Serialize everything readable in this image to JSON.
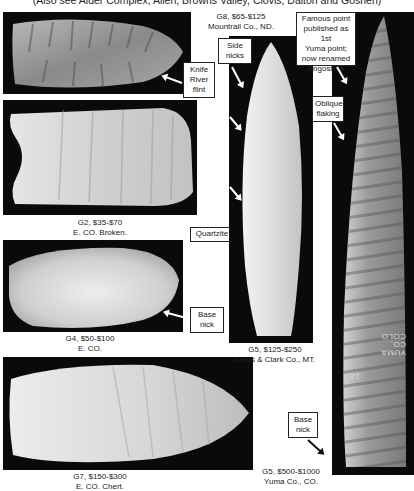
{
  "header": {
    "text": "(Also see Alder Complex, Allen, Browns Valley, Clovis, Dalton and Goshen)"
  },
  "points": [
    {
      "id": "g8",
      "grade": "G8, $65-$125",
      "location": "Mountrail Co., ND.",
      "callouts": [
        "Knife River flint"
      ]
    },
    {
      "id": "g2",
      "grade": "G2, $35-$70",
      "location": "E. CO. Broken.",
      "callouts": []
    },
    {
      "id": "g4",
      "grade": "G4, $50-$100",
      "location": "E. CO.",
      "callouts": [
        "Quartzite",
        "Base nick"
      ]
    },
    {
      "id": "g7",
      "grade": "G7, $150-$300",
      "location": "E. CO. Chert.",
      "callouts": []
    },
    {
      "id": "g5a",
      "grade": "G5, $125-$250",
      "location": "Lewis & Clark Co., MT.",
      "callouts": [
        "Side nicks"
      ]
    },
    {
      "id": "g5b",
      "grade": "G5, $500-$1000",
      "location": "Yuma Co., CO.",
      "callouts": [
        "Famous point published as 1st Yuma point; now renamed Angostura",
        "Oblique flaking",
        "Base nick"
      ]
    }
  ],
  "labels": {
    "knife_river": [
      "Knife",
      "River",
      "flint"
    ],
    "quartzite": "Quartzite",
    "base_nick": [
      "Base",
      "nick"
    ],
    "side_nicks": [
      "Side",
      "nicks"
    ],
    "famous": [
      "Famous point",
      "published as 1st",
      "Yuma point;",
      "now renamed",
      "Angostura"
    ],
    "oblique": [
      "Oblique",
      "flaking"
    ],
    "base_nick2": [
      "Base",
      "nick"
    ]
  },
  "ink_inscription": [
    "YUMA",
    "CO, COLO",
    "12"
  ]
}
